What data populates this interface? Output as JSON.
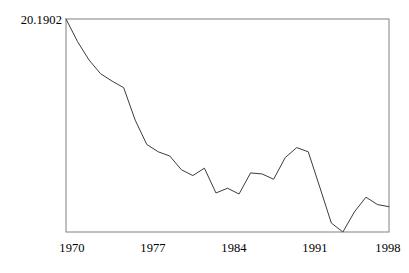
{
  "chart_data": {
    "type": "line",
    "title": "",
    "subtitle": "",
    "xlabel": "",
    "ylabel": "",
    "grid": false,
    "legend": "none",
    "y_axis": {
      "tick_labels": [
        "20.1902"
      ],
      "tick_values": [
        20.1902
      ],
      "max_label": "20.1902",
      "ylim": [
        0,
        20.1902
      ],
      "note": "Only the maximum value is labeled at the top of the axis; baseline is unlabeled."
    },
    "x_axis": {
      "tick_labels": [
        "1970",
        "1977",
        "1984",
        "1991",
        "1998"
      ],
      "tick_values": [
        1970,
        1977,
        1984,
        1991,
        1998
      ],
      "xlim": [
        1970,
        1998
      ]
    },
    "x": [
      1970,
      1971,
      1972,
      1973,
      1974,
      1975,
      1976,
      1977,
      1978,
      1979,
      1980,
      1981,
      1982,
      1983,
      1984,
      1985,
      1986,
      1987,
      1988,
      1989,
      1990,
      1991,
      1992,
      1993,
      1994,
      1995,
      1996,
      1997,
      1998
    ],
    "values": [
      20.19,
      18.05,
      16.3,
      15.0,
      14.3,
      13.68,
      10.6,
      8.3,
      7.6,
      7.2,
      5.9,
      5.35,
      6.05,
      3.7,
      4.15,
      3.6,
      5.6,
      5.5,
      5.0,
      7.05,
      8.0,
      7.6,
      4.25,
      0.85,
      0.0,
      1.9,
      3.3,
      2.6,
      2.4
    ],
    "series": [
      {
        "name": "series-1",
        "color": "#3c3c3c",
        "values": [
          20.19,
          18.05,
          16.3,
          15.0,
          14.3,
          13.68,
          10.6,
          8.3,
          7.6,
          7.2,
          5.9,
          5.35,
          6.05,
          3.7,
          4.15,
          3.6,
          5.6,
          5.5,
          5.0,
          7.05,
          8.0,
          7.6,
          4.25,
          0.85,
          0.0,
          1.9,
          3.3,
          2.6,
          2.4
        ]
      }
    ],
    "annotations": []
  },
  "axis": {
    "y_max_label": "20.1902",
    "x_ticks": [
      {
        "label": "1970"
      },
      {
        "label": "1977"
      },
      {
        "label": "1984"
      },
      {
        "label": "1991"
      },
      {
        "label": "1998"
      }
    ]
  },
  "style": {
    "line_color": "#3c3c3c",
    "frame_color": "#808080",
    "background": "#ffffff",
    "text_color": "#000000"
  },
  "geometry": {
    "plot_left": 66,
    "plot_right": 389,
    "plot_top": 19,
    "plot_bottom": 232
  }
}
